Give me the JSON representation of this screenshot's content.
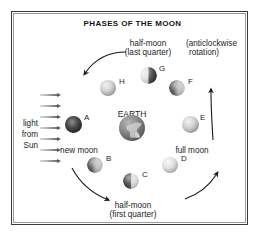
{
  "figure": {
    "title": "PHASES OF THE MOON",
    "type": "diagram"
  },
  "annotations": {
    "top_label_line1": "half-moon",
    "top_label_line2": "(last quarter)",
    "rotation_line1": "(anticlockwise",
    "rotation_line2": "rotation)",
    "bottom_label_line1": "half-moon",
    "bottom_label_line2": "(first quarter)",
    "new_moon": "new moon",
    "full_moon": "full moon",
    "earth": "EARTH",
    "light_line1": "light",
    "light_line2": "from",
    "light_line3": "Sun"
  },
  "moons": [
    {
      "id": "A",
      "label": "A",
      "phase": "new moon",
      "shading": "new",
      "x": 73,
      "y": 124,
      "r": 8.5,
      "letter_x": 84,
      "letter_y": 114
    },
    {
      "id": "B",
      "label": "B",
      "phase": "waxing crescent",
      "shading": "gib-right",
      "x": 95,
      "y": 165,
      "r": 8.0,
      "letter_x": 106,
      "letter_y": 155
    },
    {
      "id": "C",
      "label": "C",
      "phase": "half-moon (first quarter)",
      "shading": "lit-right",
      "x": 131,
      "y": 181,
      "r": 8.0,
      "letter_x": 142,
      "letter_y": 171
    },
    {
      "id": "D",
      "label": "D",
      "phase": "waxing gibbous",
      "shading": "bright",
      "x": 170,
      "y": 165,
      "r": 8.0,
      "letter_x": 181,
      "letter_y": 155
    },
    {
      "id": "E",
      "label": "E",
      "phase": "full moon",
      "shading": "full",
      "x": 190,
      "y": 124,
      "r": 8.5,
      "letter_x": 200,
      "letter_y": 114
    },
    {
      "id": "F",
      "label": "F",
      "phase": "waning gibbous",
      "shading": "gib-right",
      "x": 177,
      "y": 88,
      "r": 8.0,
      "letter_x": 188,
      "letter_y": 78
    },
    {
      "id": "G",
      "label": "G",
      "phase": "half-moon (last quarter)",
      "shading": "lit-left",
      "x": 148,
      "y": 75,
      "r": 8.5,
      "letter_x": 159,
      "letter_y": 65
    },
    {
      "id": "H",
      "label": "H",
      "phase": "waning crescent",
      "shading": "full",
      "x": 108,
      "y": 88,
      "r": 8.0,
      "letter_x": 119,
      "letter_y": 78
    }
  ],
  "earth": {
    "x": 132,
    "y": 128,
    "r": 13
  },
  "sun_rays": {
    "count": 7,
    "x": 40,
    "length": 22,
    "y_values": [
      95,
      106,
      117,
      128,
      139,
      150,
      161
    ]
  },
  "orbit": {
    "direction": "anticlockwise",
    "center_x": 132,
    "center_y": 128,
    "radius": 56
  },
  "colors": {
    "frame": "#3a3a3a",
    "text": "#1d1d1d",
    "background": "#ffffff",
    "ray": "#5a5a5a",
    "arrow": "#1a1a1a"
  }
}
